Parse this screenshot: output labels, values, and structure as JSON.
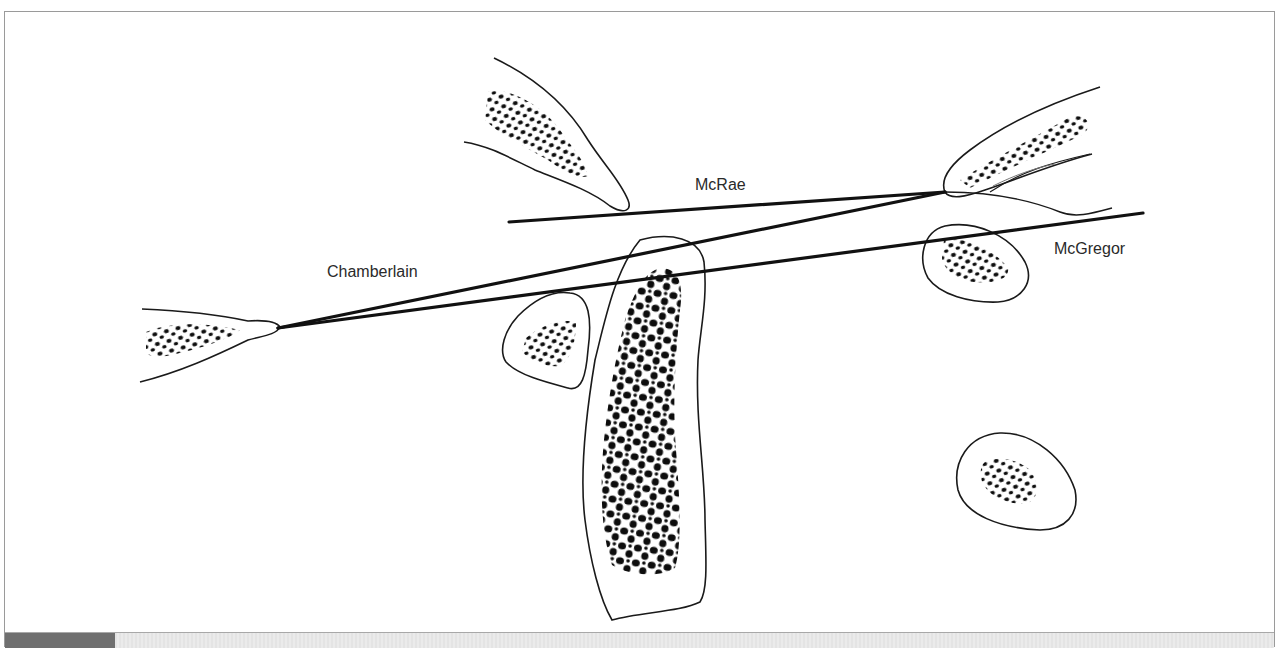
{
  "figure": {
    "type": "anatomical line diagram",
    "lines": [
      {
        "name": "McRae",
        "label": "McRae",
        "from": [
          509,
          222
        ],
        "to": [
          945,
          192
        ]
      },
      {
        "name": "Chamberlain",
        "label": "Chamberlain",
        "from": [
          278,
          328
        ],
        "to": [
          945,
          192
        ]
      },
      {
        "name": "McGregor",
        "label": "McGregor",
        "from": [
          278,
          328
        ],
        "to": [
          1143,
          213
        ]
      }
    ],
    "labels": {
      "mcrae": "McRae",
      "chamberlain": "Chamberlain",
      "mcgregor": "McGregor"
    },
    "colors": {
      "line": "#111111",
      "outline": "#1a1a1a",
      "trabecular": "#0d0d0d",
      "frame": "#9a9a9a",
      "caption_tab": "#6f6f6f",
      "caption_bar": "#e6e6e6"
    }
  },
  "caption_bar": {
    "visible": true
  }
}
